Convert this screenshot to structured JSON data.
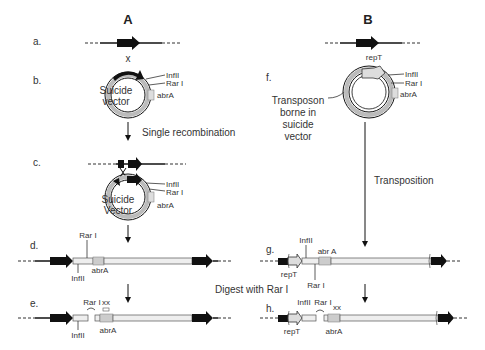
{
  "panels": {
    "A": {
      "header": "A",
      "steps": {
        "a": "a.",
        "b": "b.",
        "c": "c.",
        "d": "d.",
        "e": "e."
      },
      "b": {
        "gene_label": "x",
        "vector_line1": "Suicide",
        "vector_line2": "vector",
        "site1": "InfII",
        "site2": "Rar I",
        "marker": "abrA"
      },
      "arrow1_label": "Single recombination",
      "c": {
        "vector_line1": "Suicide",
        "vector_line2": "Vector",
        "site1": "InfII",
        "site2": "Rar I",
        "marker": "abrA"
      },
      "d": {
        "rar": "Rar I",
        "marker": "abrA",
        "inf": "InfII"
      },
      "e": {
        "rar": "Rar I",
        "xx": "xx",
        "marker": "abrA",
        "inf": "InfII"
      }
    },
    "B": {
      "header": "B",
      "steps": {
        "f": "f.",
        "g": "g.",
        "h": "h."
      },
      "f": {
        "rep": "repT",
        "site1": "InfII",
        "site2": "Rar I",
        "marker": "abrA",
        "note_line1": "Transposon",
        "note_line2": "borne in",
        "note_line3": "suicide",
        "note_line4": "vector"
      },
      "arrow_label": "Transposition",
      "g": {
        "inf": "InfII",
        "marker": "abr A",
        "rep": "repT",
        "rar": "Rar I"
      },
      "h": {
        "inf": "InfII",
        "rar": "Rar I",
        "xx": "xx",
        "rep": "repT",
        "marker": "abrA"
      }
    }
  },
  "shared": {
    "digest_label": "Digest with Rar I"
  },
  "colors": {
    "ink": "#111111",
    "vector_fill": "#d9d9d9",
    "marker_fill": "#c8c8c8",
    "background": "#ffffff"
  }
}
